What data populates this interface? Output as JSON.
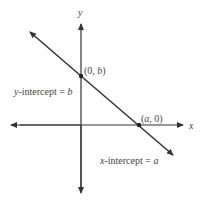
{
  "diagram": {
    "axes": {
      "x_label": "x",
      "y_label": "y"
    },
    "points": {
      "y_intercept": {
        "label_open": "(0, ",
        "var": "b",
        "label_close": ")"
      },
      "x_intercept": {
        "label_open": "(",
        "var": "a",
        "label_close": ", 0)"
      }
    },
    "annotations": {
      "y_intercept": {
        "prefix": "y",
        "text": "-intercept = ",
        "var": "b"
      },
      "x_intercept": {
        "prefix": "x",
        "text": "-intercept = ",
        "var": "a"
      }
    },
    "colors": {
      "line": "#333333",
      "text": "#444444"
    }
  }
}
